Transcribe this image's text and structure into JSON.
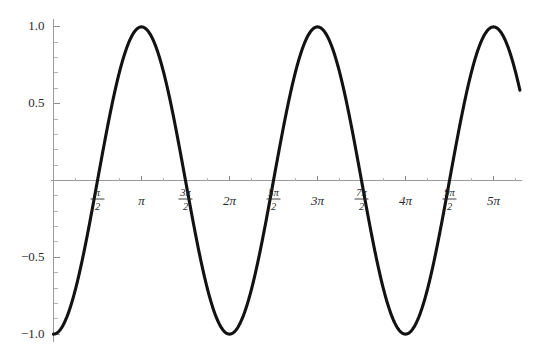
{
  "chart_data": {
    "type": "line",
    "title": "",
    "subtitle": "",
    "xlabel": "",
    "ylabel": "",
    "function": "-cos(x)",
    "grid": false,
    "legend": null,
    "xlim": [
      0,
      16.65
    ],
    "ylim": [
      -1.0,
      1.0
    ],
    "x_tick_labels": [
      "π/2",
      "π",
      "3π/2",
      "2π",
      "5π/2",
      "3π",
      "7π/2",
      "4π",
      "9π/2",
      "5π"
    ],
    "x_tick_values": [
      1.5708,
      3.1416,
      4.7124,
      6.2832,
      7.854,
      9.4248,
      10.9956,
      12.5664,
      14.1372,
      15.708
    ],
    "x_tick_parts": [
      {
        "label": "π/2",
        "numerator": "π",
        "denominator": "2",
        "fraction": true
      },
      {
        "label": "π",
        "numerator": "π",
        "denominator": "",
        "fraction": false
      },
      {
        "label": "3π/2",
        "numerator": "3π",
        "denominator": "2",
        "fraction": true
      },
      {
        "label": "2π",
        "numerator": "2π",
        "denominator": "",
        "fraction": false
      },
      {
        "label": "5π/2",
        "numerator": "5π",
        "denominator": "2",
        "fraction": true
      },
      {
        "label": "3π",
        "numerator": "3π",
        "denominator": "",
        "fraction": false
      },
      {
        "label": "7π/2",
        "numerator": "7π",
        "denominator": "2",
        "fraction": true
      },
      {
        "label": "4π",
        "numerator": "4π",
        "denominator": "",
        "fraction": false
      },
      {
        "label": "9π/2",
        "numerator": "9π",
        "denominator": "2",
        "fraction": true
      },
      {
        "label": "5π",
        "numerator": "5π",
        "denominator": "",
        "fraction": false
      }
    ],
    "y_tick_labels": [
      "1.0",
      "0.5",
      "-0.5",
      "-1.0"
    ],
    "y_tick_values": [
      1.0,
      0.5,
      -0.5,
      -1.0
    ],
    "y_minor_count_per_interval": 4,
    "x_minor_count_per_interval": 1,
    "series": [
      {
        "name": "-cos(x)",
        "color": "#121212",
        "line_width": 3.1,
        "x_start": 0,
        "x_end": 16.65,
        "maxima_x": [
          1.5708,
          4.7124,
          7.854,
          10.9956,
          14.1372
        ],
        "maxima_y": [
          1.0,
          1.0,
          1.0,
          1.0,
          1.0
        ],
        "minima_x": [
          0,
          3.1416,
          6.2832,
          9.4248,
          12.5664,
          15.708
        ],
        "minima_y": [
          -1.0,
          -1.0,
          -1.0,
          -1.0,
          -1.0,
          -1.0
        ],
        "zero_crossings": [
          0.7854,
          2.3562,
          3.927,
          5.4978,
          7.0686,
          8.6394,
          10.2102,
          11.781,
          13.3518,
          14.9226,
          16.4934
        ]
      }
    ],
    "colors": {
      "curve": "#121212",
      "axis": "#9a9a9a",
      "tick_major": "#8e8e8e",
      "tick_minor": "#b4b4b4",
      "label_text": "#2b2b2b",
      "background": "#ffffff"
    }
  }
}
